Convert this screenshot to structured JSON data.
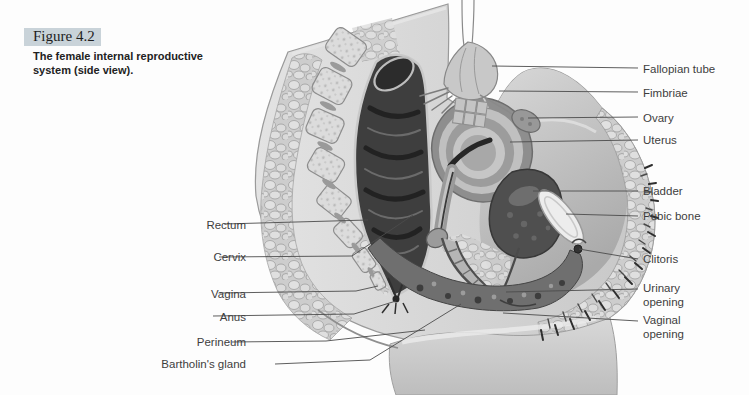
{
  "caption": {
    "number": "Figure 4.2",
    "description": "The female internal reproductive system (side view)."
  },
  "labels": {
    "left": [
      "Rectum",
      "Cervix",
      "Vagina",
      "Anus",
      "Perineum",
      "Bartholin's gland"
    ],
    "right": [
      "Fallopian tube",
      "Fimbriae",
      "Ovary",
      "Uterus",
      "Bladder",
      "Pubic bone",
      "Clitoris",
      "Urinary opening",
      "Vaginal opening"
    ]
  },
  "illustration": {
    "subject": "female internal reproductive system, sagittal side view",
    "style": "grayscale medical line illustration",
    "colors": {
      "caption_highlight": "#c9d3d9",
      "leader_line": "#4c4c4c",
      "label_ink": "#3d3d3d",
      "tissue_light": "#d2d2d2",
      "organ_dark": "#3e3e3e"
    }
  }
}
